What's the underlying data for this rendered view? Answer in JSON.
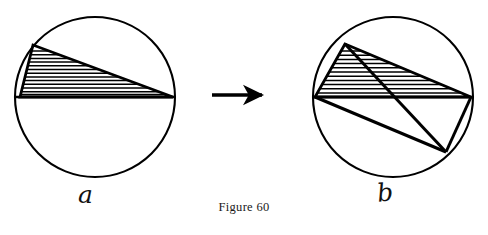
{
  "figure": {
    "caption": "Figure 60",
    "background_color": "#ffffff",
    "ink_color": "#000000",
    "panels": [
      {
        "id": "a",
        "label": "a",
        "circle": {
          "cx": 95,
          "cy": 97,
          "r": 80
        },
        "diameter_chord": {
          "x1": 15,
          "y1": 97,
          "x2": 175,
          "y2": 97
        },
        "hatched_triangle": {
          "vertices": [
            [
              33,
              45
            ],
            [
              20,
              97
            ],
            [
              173,
              97
            ]
          ],
          "hatch": "horizontal",
          "hatch_line_count": 14
        },
        "description": "Circle with an inscribed hatched triangle sitting on the horizontal diameter, apex near the upper left of the arc"
      },
      {
        "id": "b",
        "label": "b",
        "circle": {
          "cx": 393,
          "cy": 97,
          "r": 80
        },
        "diameter_chord": {
          "x1": 313,
          "y1": 97,
          "x2": 473,
          "y2": 97
        },
        "hatched_triangle": {
          "vertices": [
            [
              345,
              44
            ],
            [
              315,
              97
            ],
            [
              471,
              97
            ]
          ],
          "hatch": "horizontal",
          "hatch_line_count": 11
        },
        "extra_lines": [
          {
            "from": [
              345,
              44
            ],
            "to": [
              446,
              152
            ],
            "name": "apex-to-lower-right"
          },
          {
            "from": [
              315,
              97
            ],
            "to": [
              446,
              152
            ],
            "name": "left-to-lower-right"
          },
          {
            "from": [
              471,
              97
            ],
            "to": [
              446,
              152
            ],
            "name": "right-to-lower-right"
          }
        ],
        "description": "Same circle after the triangle is cut and rearranged: the hatched triangle plus a second triangle reaching the lower right of the circle"
      }
    ],
    "arrow": {
      "name": "transformation-arrow",
      "direction": "right",
      "from": [
        212,
        95
      ],
      "to": [
        268,
        95
      ]
    }
  }
}
